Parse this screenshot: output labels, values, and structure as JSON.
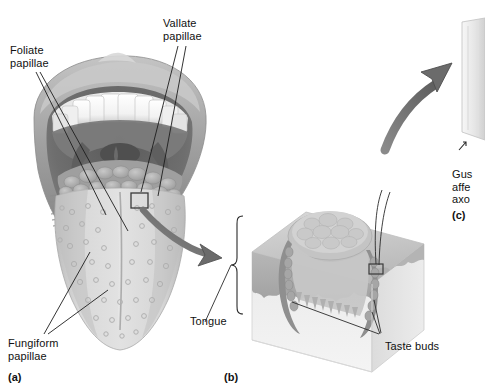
{
  "figure": {
    "title_visible": false,
    "background_color": "#ffffff",
    "width": 485,
    "height": 389
  },
  "labels": {
    "foliate_papillae": "Foliate\npapillae",
    "vallate_papillae": "Vallate\npapillae",
    "fungiform_papillae": "Fungiform\npapillae",
    "tongue": "Tongue",
    "taste_buds": "Taste buds",
    "gustatory_afferent_axons": "Gus\naffe\naxo"
  },
  "panels": {
    "a": "(a)",
    "b": "(b)",
    "c": "(c)"
  },
  "colors": {
    "line": "#1a1a1a",
    "arrow": "#6f6f6f",
    "arrow_edge": "#4a4a4a",
    "lip": "#9a9a9a",
    "lip_light": "#c9c9c9",
    "teeth": "#fbfbfb",
    "teeth_shadow": "#cfcfcf",
    "oral_cavity": "#6a6a6a",
    "oral_dark": "#4d4d4d",
    "tongue_body": "#d5d5d5",
    "tongue_shade": "#b6b6b6",
    "papillae": "#a8a8a8",
    "block_top": "#cdcdcd",
    "block_face": "#e6e6e6",
    "block_side": "#d2d2d2",
    "epithelium": "#b9b9b9",
    "trench": "#8e8e8e",
    "panel_c_fill": "#efefef",
    "panel_c_edge": "#c2c2c2"
  }
}
